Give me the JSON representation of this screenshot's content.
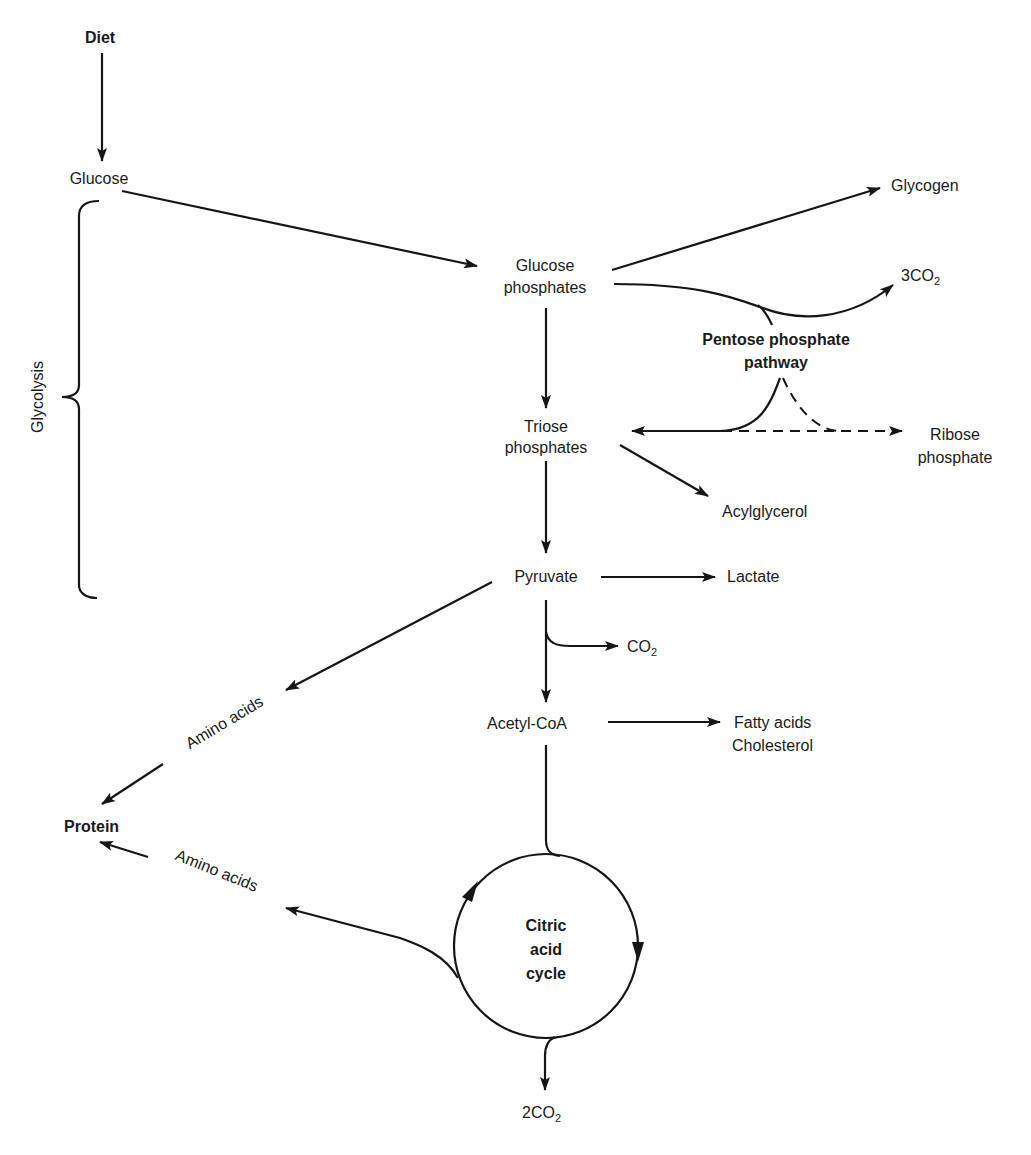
{
  "diagram": {
    "nodes": {
      "diet": "Diet",
      "glucose": "Glucose",
      "glycogen": "Glycogen",
      "glucose_phosphates_1": "Glucose",
      "glucose_phosphates_2": "phosphates",
      "co2_3_prefix": "3CO",
      "co2_3_sub": "2",
      "pentose_1": "Pentose phosphate",
      "pentose_2": "pathway",
      "triose_1": "Triose",
      "triose_2": "phosphates",
      "ribose_1": "Ribose",
      "ribose_2": "phosphate",
      "acylglycerol": "Acylglycerol",
      "pyruvate": "Pyruvate",
      "lactate": "Lactate",
      "co2_prefix": "CO",
      "co2_sub": "2",
      "acetyl_coa": "Acetyl-CoA",
      "fatty_acids": "Fatty acids",
      "cholesterol": "Cholesterol",
      "amino_acids_upper": "Amino acids",
      "amino_acids_lower": "Amino acids",
      "protein": "Protein",
      "citric_1": "Citric",
      "citric_2": "acid",
      "citric_3": "cycle",
      "co2_2_prefix": "2CO",
      "co2_2_sub": "2"
    },
    "bracket_label": "Glycolysis",
    "edges": [
      {
        "from": "Diet",
        "to": "Glucose",
        "style": "solid"
      },
      {
        "from": "Glucose",
        "to": "Glucose phosphates",
        "style": "solid"
      },
      {
        "from": "Glucose phosphates",
        "to": "Glycogen",
        "style": "solid"
      },
      {
        "from": "Glucose phosphates",
        "to": "3CO2",
        "via": "Pentose phosphate pathway",
        "style": "solid"
      },
      {
        "from": "Glucose phosphates",
        "to": "Triose phosphates",
        "style": "solid"
      },
      {
        "from": "Pentose phosphate pathway",
        "to": "Triose phosphates",
        "style": "solid"
      },
      {
        "from": "Pentose phosphate pathway",
        "to": "Ribose phosphate",
        "style": "dashed"
      },
      {
        "from": "Triose phosphates",
        "to": "Acylglycerol",
        "style": "solid"
      },
      {
        "from": "Triose phosphates",
        "to": "Pyruvate",
        "style": "solid"
      },
      {
        "from": "Pyruvate",
        "to": "Lactate",
        "style": "solid"
      },
      {
        "from": "Pyruvate",
        "to": "CO2",
        "style": "solid"
      },
      {
        "from": "Pyruvate",
        "to": "Acetyl-CoA",
        "style": "solid"
      },
      {
        "from": "Pyruvate",
        "to": "Amino acids",
        "style": "solid"
      },
      {
        "from": "Amino acids",
        "to": "Protein",
        "style": "solid"
      },
      {
        "from": "Acetyl-CoA",
        "to": "Fatty acids / Cholesterol",
        "style": "solid"
      },
      {
        "from": "Acetyl-CoA",
        "to": "Citric acid cycle",
        "style": "solid"
      },
      {
        "from": "Citric acid cycle",
        "to": "Amino acids",
        "style": "solid"
      },
      {
        "from": "Amino acids",
        "to": "Protein",
        "style": "solid"
      },
      {
        "from": "Citric acid cycle",
        "to": "2CO2",
        "style": "solid"
      }
    ]
  }
}
